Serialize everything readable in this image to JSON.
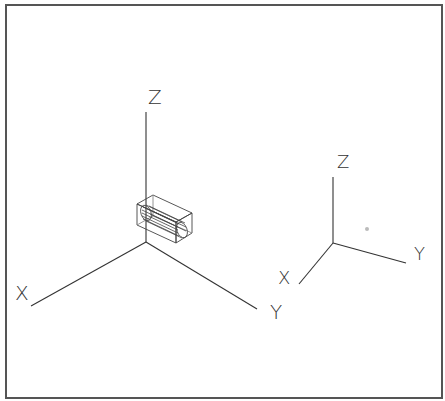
{
  "viewport": {
    "background": "#ffffff",
    "border_color": "#555555"
  },
  "main_triad": {
    "origin": [
      146,
      242
    ],
    "axes": {
      "x": {
        "label": "X",
        "end": [
          31,
          306
        ],
        "label_pos": [
          16,
          299
        ]
      },
      "y": {
        "label": "Y",
        "end": [
          257,
          309
        ],
        "label_pos": [
          271,
          318
        ]
      },
      "z": {
        "label": "Z",
        "end": [
          146,
          112
        ],
        "label_pos": [
          149,
          104
        ]
      }
    }
  },
  "view_triad": {
    "origin": [
      333,
      243
    ],
    "axes": {
      "x": {
        "label": "X",
        "end": [
          299,
          284
        ],
        "label_pos": [
          279,
          283
        ]
      },
      "y": {
        "label": "Y",
        "end": [
          406,
          263
        ],
        "label_pos": [
          415,
          259
        ]
      },
      "z": {
        "label": "Z",
        "end": [
          333,
          177
        ],
        "label_pos": [
          338,
          167
        ]
      }
    }
  },
  "model": {
    "name": "cylinder-in-bounding-box",
    "line_color": "#444444"
  },
  "marker": {
    "pos": [
      367,
      229
    ],
    "color": "#bbbbbb"
  }
}
